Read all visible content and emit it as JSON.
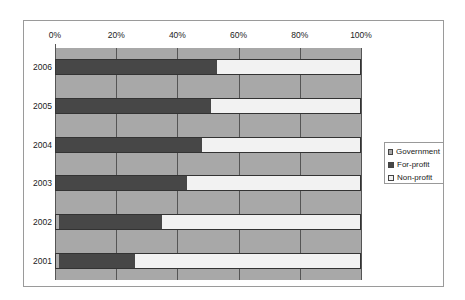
{
  "chart_data": {
    "type": "bar",
    "orientation": "horizontal",
    "stacked": "percent",
    "title": "",
    "xlabel": "",
    "ylabel": "",
    "x_ticks": [
      "0%",
      "20%",
      "40%",
      "60%",
      "80%",
      "100%"
    ],
    "xlim": [
      0,
      100
    ],
    "categories": [
      "2006",
      "2005",
      "2004",
      "2003",
      "2002",
      "2001"
    ],
    "series": [
      {
        "name": "Government",
        "color": "#a8a8a8",
        "values": [
          0,
          0,
          0,
          0,
          1,
          1
        ]
      },
      {
        "name": "For-profit",
        "color": "#474747",
        "values": [
          53,
          51,
          48,
          43,
          34,
          25
        ]
      },
      {
        "name": "Non-profit",
        "color": "#f2f2f2",
        "values": [
          47,
          49,
          52,
          57,
          65,
          74
        ]
      }
    ],
    "legend": {
      "position": "right",
      "entries": [
        "Government",
        "For-profit",
        "Non-profit"
      ]
    },
    "grid": true
  },
  "legend": {
    "items": [
      {
        "label": "Government",
        "color": "#a8a8a8"
      },
      {
        "label": "For-profit",
        "color": "#474747"
      },
      {
        "label": "Non-profit",
        "color": "#f2f2f2"
      }
    ]
  }
}
